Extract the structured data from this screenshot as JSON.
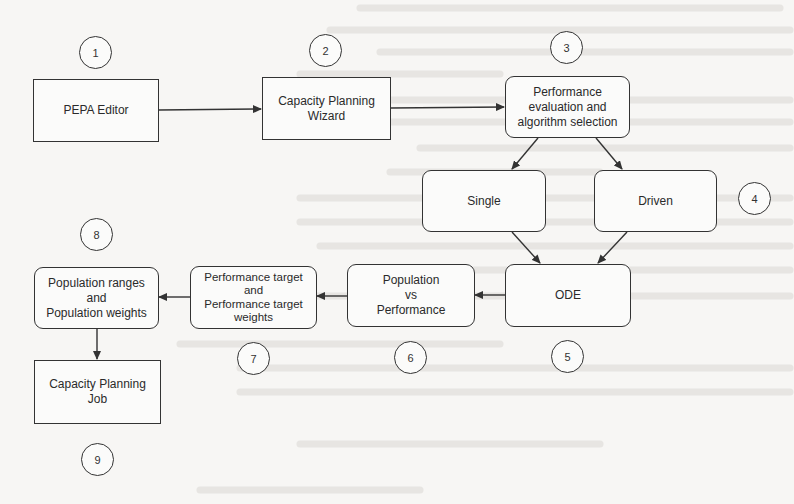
{
  "diagram": {
    "type": "flowchart",
    "nodes": [
      {
        "id": "n1",
        "step": "1",
        "label": "PEPA Editor",
        "shape": "rectangle"
      },
      {
        "id": "n2",
        "step": "2",
        "label": "Capacity Planning\nWizard",
        "shape": "rectangle"
      },
      {
        "id": "n3",
        "step": "3",
        "label": "Performance\nevaluation and\nalgorithm selection",
        "shape": "rounded"
      },
      {
        "id": "n4a",
        "step": "4",
        "label": "Single",
        "shape": "rounded"
      },
      {
        "id": "n4b",
        "step": "4",
        "label": "Driven",
        "shape": "rounded"
      },
      {
        "id": "n5",
        "step": "5",
        "label": "ODE",
        "shape": "rounded"
      },
      {
        "id": "n6",
        "step": "6",
        "label": "Population\nvs\nPerformance",
        "shape": "rounded"
      },
      {
        "id": "n7",
        "step": "7",
        "label": "Performance target\nand\nPerformance target\nweights",
        "shape": "rounded"
      },
      {
        "id": "n8",
        "step": "8",
        "label": "Population ranges\nand\nPopulation weights",
        "shape": "rounded"
      },
      {
        "id": "n9",
        "step": "9",
        "label": "Capacity Planning\nJob",
        "shape": "rectangle"
      }
    ],
    "edges": [
      {
        "from": "n1",
        "to": "n2"
      },
      {
        "from": "n2",
        "to": "n3"
      },
      {
        "from": "n3",
        "to": "n4a"
      },
      {
        "from": "n3",
        "to": "n4b"
      },
      {
        "from": "n4a",
        "to": "n5"
      },
      {
        "from": "n4b",
        "to": "n5"
      },
      {
        "from": "n5",
        "to": "n6"
      },
      {
        "from": "n6",
        "to": "n7"
      },
      {
        "from": "n7",
        "to": "n8"
      },
      {
        "from": "n8",
        "to": "n9"
      }
    ],
    "badges": [
      "1",
      "2",
      "3",
      "4",
      "5",
      "6",
      "7",
      "8",
      "9"
    ],
    "colors": {
      "stroke": "#333333",
      "text": "#2a2a2a",
      "background": "#f7f6f4"
    }
  }
}
